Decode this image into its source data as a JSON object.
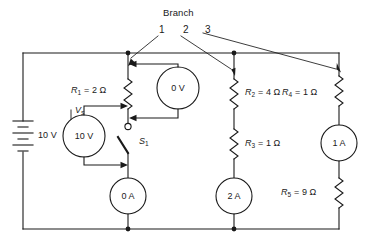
{
  "figure": {
    "title": "Branch",
    "branch_numbers": [
      "1",
      "2",
      "3"
    ]
  },
  "source": {
    "symbol_label": "V",
    "symbol_sub": "s",
    "value": "10 V"
  },
  "resistors": [
    {
      "name": "R",
      "sub": "1",
      "label": "R1 = 2 Ω",
      "text": " = 2 Ω",
      "value": "2 Ω"
    },
    {
      "name": "R",
      "sub": "2",
      "label": "R2 = 4 Ω",
      "text": " = 4 Ω",
      "value": "4 Ω"
    },
    {
      "name": "R",
      "sub": "3",
      "label": "R3 = 1 Ω",
      "text": " = 1 Ω",
      "value": "1 Ω"
    },
    {
      "name": "R",
      "sub": "4",
      "label": "R4 = 1 Ω",
      "text": " = 1 Ω",
      "value": "1 Ω"
    },
    {
      "name": "R",
      "sub": "5",
      "label": "R5 = 9 Ω",
      "text": " = 9 Ω",
      "value": "9 Ω"
    }
  ],
  "switch": {
    "name": "S",
    "sub": "1",
    "state": "open"
  },
  "meters": [
    {
      "id": "voltmeter-source",
      "reading": "10 V",
      "type": "voltmeter"
    },
    {
      "id": "voltmeter-r1",
      "reading": "0 V",
      "type": "voltmeter"
    },
    {
      "id": "ammeter-branch1",
      "reading": "0 A",
      "type": "ammeter"
    },
    {
      "id": "ammeter-branch2",
      "reading": "2 A",
      "type": "ammeter"
    },
    {
      "id": "ammeter-branch3",
      "reading": "1 A",
      "type": "ammeter"
    }
  ],
  "colors": {
    "wire": "#1a1a1a",
    "text": "#1a1a1a",
    "background": "#ffffff"
  }
}
